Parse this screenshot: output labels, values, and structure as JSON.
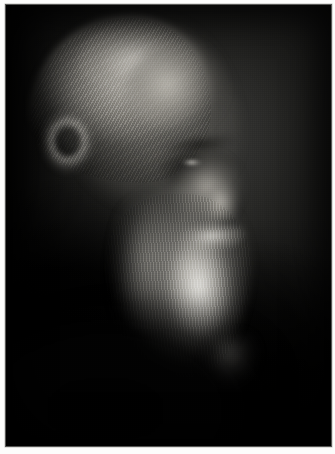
{
  "page": {
    "background_color": "#fdfdfc",
    "width": 335,
    "height": 454
  },
  "photo": {
    "caption": "",
    "alt_text": "Black and white profile portrait of an elderly bearded man with long swept-back white hair and a flowing white beard, lit from the left against a dark studio background",
    "subject": "elderly bearded man in three-quarter profile",
    "medium": "monochrome halftone photographic print",
    "orientation": "portrait",
    "frame": {
      "left": 5,
      "top": 4,
      "width": 327,
      "height": 443,
      "border_color": "#bebeba"
    },
    "palette": {
      "background_dark": "#0b0b0b",
      "backdrop_mid": "#2c2c2a",
      "skin_midtone": "#8f8c86",
      "highlight": "#f3f1ec",
      "shadow": "#050505",
      "border": "#bebeba",
      "page": "#fdfdfc"
    },
    "regions": [
      {
        "name": "hair",
        "description": "swept silver hair over crown and ear",
        "tone": "light"
      },
      {
        "name": "forehead",
        "description": "lit forehead and temple",
        "tone": "mid-light"
      },
      {
        "name": "eye",
        "description": "deep-set eye in socket shadow",
        "tone": "dark"
      },
      {
        "name": "nose",
        "description": "nose bridge and tip highlight",
        "tone": "light"
      },
      {
        "name": "mustache",
        "description": "white mustache over upper lip",
        "tone": "light"
      },
      {
        "name": "beard",
        "description": "long flowing white beard",
        "tone": "bright"
      },
      {
        "name": "shoulders",
        "description": "dark coat merging into background",
        "tone": "black"
      },
      {
        "name": "backdrop",
        "description": "mottled dark studio backdrop",
        "tone": "dark"
      }
    ]
  }
}
